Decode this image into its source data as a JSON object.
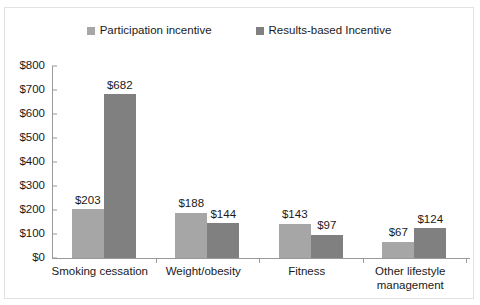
{
  "chart_data": {
    "type": "bar",
    "title": "",
    "xlabel": "",
    "ylabel": "",
    "categories": [
      "Smoking cessation",
      "Weight/obesity",
      "Fitness",
      "Other lifestyle management"
    ],
    "series": [
      {
        "name": "Participation incentive",
        "color": "#a6a6a6",
        "values": [
          203,
          188,
          143,
          67
        ],
        "labels": [
          "$203",
          "$188",
          "$143",
          "$67"
        ]
      },
      {
        "name": "Results-based Incentive",
        "color": "#808080",
        "values": [
          682,
          144,
          97,
          124
        ],
        "labels": [
          "$682",
          "$144",
          "$97",
          "$124"
        ]
      }
    ],
    "ylim": [
      0,
      800
    ],
    "ytick_values": [
      0,
      100,
      200,
      300,
      400,
      500,
      600,
      700,
      800
    ],
    "ytick_labels": [
      "$0",
      "$100",
      "$200",
      "$300",
      "$400",
      "$500",
      "$600",
      "$700",
      "$800"
    ],
    "grid": false,
    "legend_position": "top",
    "value_labels_shown": true
  },
  "legend": {
    "entries": [
      {
        "label": "Participation incentive",
        "color": "#a6a6a6"
      },
      {
        "label": "Results-based Incentive",
        "color": "#808080"
      }
    ]
  },
  "axis": {
    "y_labels": [
      "$800",
      "$700",
      "$600",
      "$500",
      "$400",
      "$300",
      "$200",
      "$100",
      "$0"
    ],
    "x_labels": [
      "Smoking cessation",
      "Weight/obesity",
      "Fitness",
      "Other lifestyle management"
    ]
  }
}
